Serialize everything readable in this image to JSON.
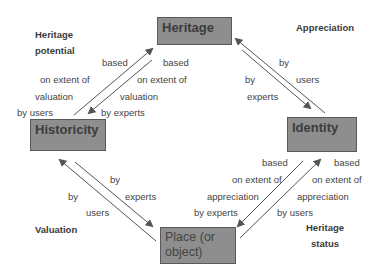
{
  "nodes": {
    "heritage": "Heritage",
    "historicity": "Historicity",
    "identity": "Identity",
    "place": "Place (or object)"
  },
  "corners": {
    "top_left": [
      "Heritage",
      "potential"
    ],
    "top_right": [
      "Appreciation"
    ],
    "bottom_left": [
      "Valuation"
    ],
    "bottom_right": [
      "Heritage",
      "status"
    ]
  },
  "edges": {
    "historicity_to_heritage": [
      "based",
      "on extent of",
      "valuation",
      "by users"
    ],
    "heritage_to_historicity": [
      "based",
      "on extent of",
      "valuation",
      "by experts"
    ],
    "identity_to_heritage": [
      "by",
      "users"
    ],
    "heritage_to_identity": [
      "by",
      "experts"
    ],
    "place_to_historicity": [
      "by",
      "users"
    ],
    "historicity_to_place": [
      "by",
      "experts"
    ],
    "identity_to_place": [
      "based",
      "on extent of",
      "appreciation",
      "by experts"
    ],
    "place_to_identity": [
      "based",
      "on extent of",
      "appreciation",
      "by users"
    ]
  },
  "colors": {
    "box_fill": "#8e8e8e",
    "box_border": "#5a5a5a",
    "arrow": "#555555"
  }
}
